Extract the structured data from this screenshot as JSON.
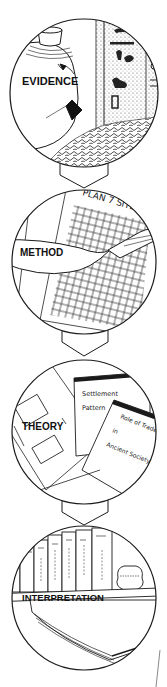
{
  "diagram": {
    "type": "process-flow",
    "direction": "top-to-bottom",
    "stages": [
      {
        "id": "evidence",
        "label": "EVIDENCE",
        "scene": "broken ceramic jar beside a hieroglyphic stone relief and rubble"
      },
      {
        "id": "method",
        "label": "METHOD",
        "scene": "trowel over a gridded site plan",
        "sheet_title": "PLAN 7 SITE"
      },
      {
        "id": "theory",
        "label": "THEORY",
        "scene": "flowchart sheet with two book covers",
        "book_1_title_lines": [
          "Settlement",
          "Pattern"
        ],
        "book_2_title_lines": [
          "Role of Trade",
          "in",
          "Ancient Society"
        ]
      },
      {
        "id": "interpretation",
        "label": "INTERPRETATION",
        "scene": "row of books on a shelf with a vase and an open book"
      }
    ],
    "connectors": [
      {
        "from": "evidence",
        "to": "method",
        "shape": "hexagonal-down-arrow"
      },
      {
        "from": "method",
        "to": "theory",
        "shape": "hexagonal-down-arrow"
      },
      {
        "from": "theory",
        "to": "interpretation",
        "shape": "hexagonal-down-arrow"
      }
    ],
    "colors": {
      "ink": "#1a1a1a",
      "paper": "#ffffff",
      "stipple": "#6a6a6a",
      "label_bg": "#ffffff"
    }
  }
}
